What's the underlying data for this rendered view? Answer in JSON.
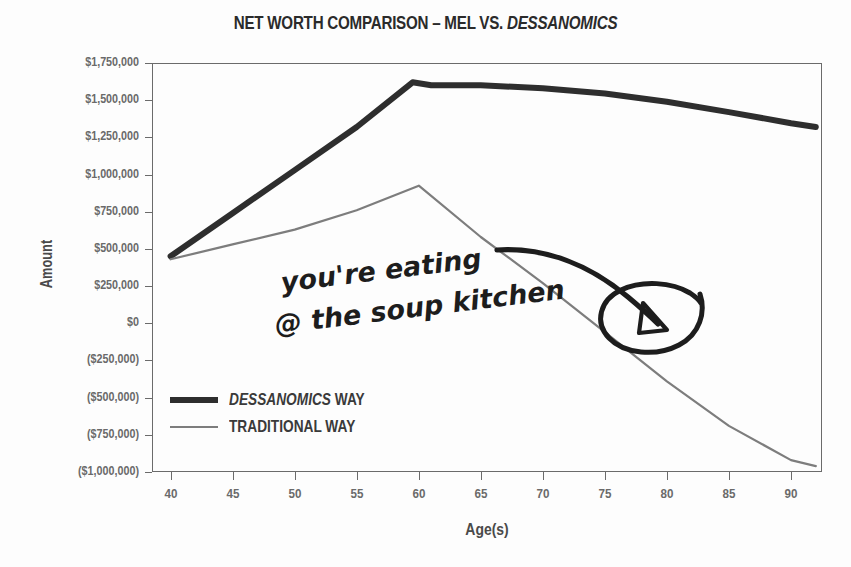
{
  "chart_data": {
    "type": "line",
    "title": "NET WORTH COMPARISON – MEL VS. DESSANOMICS",
    "title_plain": "NET WORTH COMPARISON – MEL VS. ",
    "title_italic": "DESSANOMICS",
    "xlabel": "Age(s)",
    "ylabel": "Amount",
    "xlim": [
      38.5,
      92.5
    ],
    "ylim": [
      -1000000,
      1750000
    ],
    "grid": false,
    "legend_position": "inside-lower-left",
    "x_ticks": [
      40,
      45,
      50,
      55,
      60,
      65,
      70,
      75,
      80,
      85,
      90
    ],
    "x_tick_labels": [
      "40",
      "45",
      "50",
      "55",
      "60",
      "65",
      "70",
      "75",
      "80",
      "85",
      "90"
    ],
    "y_ticks": [
      1750000,
      1500000,
      1250000,
      1000000,
      750000,
      500000,
      250000,
      0,
      -250000,
      -500000,
      -750000,
      -1000000
    ],
    "y_tick_labels": [
      "$1,750,000",
      "$1,500,000",
      "$1,250,000",
      "$1,000,000",
      "$750,000",
      "$500,000",
      "$250,000",
      "$0",
      "($250,000)",
      "($500,000)",
      "($750,000)",
      "($1,000,000)"
    ],
    "series": [
      {
        "name": "DESSANOMICS WAY",
        "name_italic": "DESSANOMICS",
        "name_plain": " WAY",
        "style": "thick",
        "color": "#2e2e2e",
        "width": 6,
        "x": [
          40,
          45,
          50,
          55,
          59.5,
          61,
          65,
          70,
          75,
          80,
          85,
          90,
          92
        ],
        "y": [
          450000,
          740000,
          1030000,
          1320000,
          1620000,
          1600000,
          1600000,
          1580000,
          1545000,
          1490000,
          1420000,
          1345000,
          1320000
        ]
      },
      {
        "name": "TRADITIONAL WAY",
        "style": "thin",
        "color": "#7d7d7d",
        "width": 2.2,
        "x": [
          40,
          45,
          50,
          55,
          60,
          65,
          70,
          75,
          80,
          85,
          90,
          92
        ],
        "y": [
          430000,
          530000,
          630000,
          760000,
          925000,
          580000,
          270000,
          -60000,
          -390000,
          -690000,
          -920000,
          -960000
        ]
      }
    ],
    "annotations": [
      {
        "type": "handwritten-text",
        "line1": "you're eating",
        "line2": "@ the soup kitchen!",
        "color": "#1d1d1d"
      },
      {
        "type": "handwritten-arrow",
        "description": "curved arrow pointing down-right to circled point",
        "color": "#1d1d1d"
      },
      {
        "type": "handwritten-circle",
        "description": "hand-drawn ellipse circling traditional-way line near age 79",
        "color": "#1d1d1d"
      }
    ]
  }
}
